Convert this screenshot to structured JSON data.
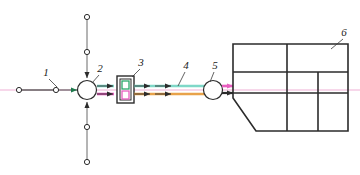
{
  "diagram": {
    "background": "#ffffff",
    "width": 360,
    "height": 175,
    "colors": {
      "line_black": "#2b2b2b",
      "line_magenta": "#e85fc0",
      "line_magenta_faint": "#f7d7ea",
      "line_green": "#2aa86a",
      "line_teal": "#7fd8c8",
      "line_orange": "#e8a24a",
      "line_gray": "#5a5a5a",
      "node_fill": "#ffffff"
    },
    "labels": [
      {
        "id": "1",
        "text": "1",
        "x": 46,
        "y": 76,
        "leader_to_x": 57,
        "leader_to_y": 87
      },
      {
        "id": "2",
        "text": "2",
        "x": 100,
        "y": 72,
        "leader_to_x": 91,
        "leader_to_y": 83
      },
      {
        "id": "3",
        "text": "3",
        "x": 141,
        "y": 66,
        "leader_to_x": 131,
        "leader_to_y": 77
      },
      {
        "id": "4",
        "text": "4",
        "x": 186,
        "y": 69,
        "leader_to_x": 178,
        "leader_to_y": 86
      },
      {
        "id": "5",
        "text": "5",
        "x": 215,
        "y": 69,
        "leader_to_x": 210,
        "leader_to_y": 82
      },
      {
        "id": "6",
        "text": "6",
        "x": 344,
        "y": 36,
        "leader_to_x": 330,
        "leader_to_y": 48
      }
    ],
    "nodes": [
      {
        "name": "terminal-circle-left-outer",
        "shape": "small-circle",
        "cx": 19,
        "cy": 90,
        "r": 2.6
      },
      {
        "name": "terminal-circle-left-inner",
        "shape": "small-circle",
        "cx": 56,
        "cy": 90,
        "r": 2.6
      },
      {
        "name": "mixer-circle",
        "shape": "circle",
        "cx": 87,
        "cy": 90,
        "r": 9.5
      },
      {
        "name": "filter-box",
        "shape": "double-rect",
        "x": 117,
        "y": 76,
        "w": 17,
        "h": 27
      },
      {
        "name": "pump-circle",
        "shape": "circle",
        "cx": 213,
        "cy": 90,
        "r": 9.5
      },
      {
        "name": "terminal-circle-top-far",
        "shape": "small-circle",
        "cx": 87,
        "cy": 17,
        "r": 2.6
      },
      {
        "name": "terminal-circle-top-near",
        "shape": "small-circle",
        "cx": 87,
        "cy": 52,
        "r": 2.6
      },
      {
        "name": "terminal-circle-bottom-near",
        "shape": "small-circle",
        "cx": 87,
        "cy": 127,
        "r": 2.6
      },
      {
        "name": "terminal-circle-bottom-far",
        "shape": "small-circle",
        "cx": 87,
        "cy": 162,
        "r": 2.6
      }
    ],
    "vessel": {
      "name": "vessel-outline",
      "left": 233,
      "top": 44,
      "right": 348,
      "bottom": 131,
      "chamfer_x": 256,
      "chamfer_y": 98,
      "h_dividers": [
        72,
        93
      ],
      "v_divider_main": 287,
      "v_divider_partial": 318
    }
  }
}
